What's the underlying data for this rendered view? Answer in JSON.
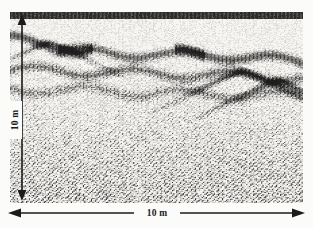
{
  "figure": {
    "kind": "gpr-radargram",
    "background_color": "#fbfbf9",
    "panel_color": "#f6f5f2",
    "ink_color": "#1b1b1b"
  },
  "depth_scale": {
    "label": "10 m",
    "orientation": "vertical",
    "arrow_style": "double-headed"
  },
  "distance_scale": {
    "label": "10 m",
    "orientation": "horizontal",
    "arrow_style": "double-headed"
  },
  "chart_data": {
    "type": "heatmap",
    "title": "",
    "subtitle": "",
    "xlabel": "10 m",
    "ylabel": "10 m",
    "x": [
      0,
      10
    ],
    "xlim": [
      0,
      10
    ],
    "ylim": [
      0,
      10
    ],
    "grid": false,
    "legend": "none",
    "annotations": [
      "10 m",
      "10 m"
    ],
    "reflectors": [
      {
        "name": "shallow-band-left",
        "x_start": 0.0,
        "x_end": 2.4,
        "depth_start": 1.4,
        "depth_end": 2.0,
        "strength": 0.85
      },
      {
        "name": "shallow-band-mid",
        "x_start": 2.0,
        "x_end": 6.2,
        "depth_start": 2.0,
        "depth_end": 2.3,
        "strength": 0.7
      },
      {
        "name": "shallow-band-right",
        "x_start": 6.0,
        "x_end": 10.0,
        "depth_start": 2.1,
        "depth_end": 2.6,
        "strength": 0.8
      },
      {
        "name": "mid-band",
        "x_start": 0.0,
        "x_end": 10.0,
        "depth_start": 3.0,
        "depth_end": 3.4,
        "strength": 0.6
      },
      {
        "name": "deep-band",
        "x_start": 0.0,
        "x_end": 10.0,
        "depth_start": 4.0,
        "depth_end": 4.4,
        "strength": 0.45
      }
    ],
    "diffractions": [
      {
        "name": "hyperbola-a",
        "apex_x": 7.9,
        "apex_depth": 3.1,
        "strength": 0.9
      },
      {
        "name": "hyperbola-b",
        "apex_x": 9.1,
        "apex_depth": 3.6,
        "strength": 0.8
      },
      {
        "name": "hyperbola-c",
        "apex_x": 1.3,
        "apex_depth": 1.6,
        "strength": 0.7
      }
    ]
  }
}
